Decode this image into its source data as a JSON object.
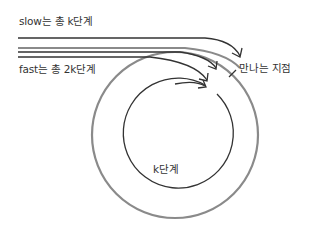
{
  "diagram": {
    "type": "cycle-detection (Floyd tortoise and hare) illustration",
    "labels": {
      "slow": "slow는 총 k단계",
      "fast": "fast는 총 2k단계",
      "meeting_point": "만나는 지점",
      "cycle_steps": "k단계"
    },
    "colors": {
      "ink": "#333333",
      "outer_cycle": "#8a8a8a",
      "background": "#ffffff"
    }
  }
}
